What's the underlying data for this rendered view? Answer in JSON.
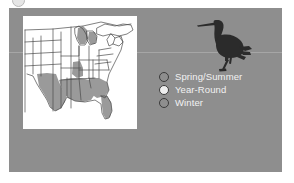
{
  "figure": {
    "type": "bird-range-map-figure",
    "panel_background": "#8e8e8e",
    "map_background": "#ffffff"
  },
  "map": {
    "name": "united-states-range-map",
    "region": "Central and Eastern United States",
    "outline_color": "#4a4a4a",
    "shaded_color": "#9a9a9a",
    "shaded_states": [
      "Texas",
      "Louisiana",
      "Mississippi",
      "Alabama",
      "Georgia",
      "Florida",
      "Arkansas",
      "Tennessee",
      "Michigan",
      "Wisconsin",
      "Illinois",
      "Indiana",
      "Ohio"
    ]
  },
  "bird": {
    "name": "heron-silhouette",
    "description": "Dark standing heron silhouette with long pointed bill and long legs",
    "color": "#2b2b2b"
  },
  "legend": {
    "items": [
      {
        "label": "Spring/Summer",
        "color": "#8e8e8e",
        "outline": "#3b3b3b"
      },
      {
        "label": "Year-Round",
        "color": "#eeeeee",
        "outline": "#3b3b3b"
      },
      {
        "label": "Winter",
        "color": "#8e8e8e",
        "outline": "#3b3b3b"
      }
    ]
  }
}
